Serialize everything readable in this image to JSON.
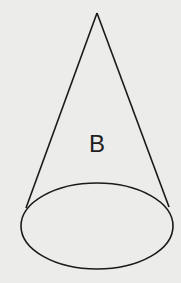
{
  "figure": {
    "label": "B",
    "shape": "cone",
    "stroke_color": "#1a1a1a",
    "background_color": "#ececea"
  }
}
